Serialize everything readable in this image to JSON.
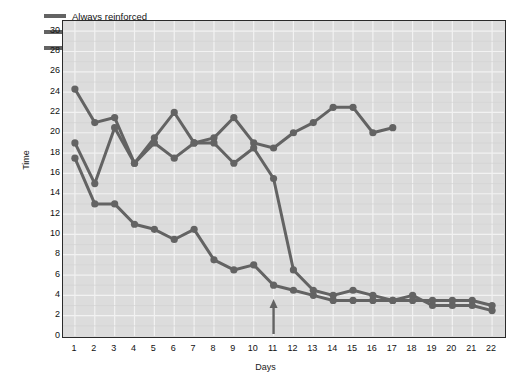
{
  "chart_data": {
    "type": "line",
    "title": "",
    "xlabel": "Days",
    "ylabel": "Time",
    "xlim": [
      0.4,
      22.6
    ],
    "ylim": [
      0,
      31
    ],
    "xticks": [
      1,
      2,
      3,
      4,
      5,
      6,
      7,
      8,
      9,
      10,
      11,
      12,
      13,
      14,
      15,
      16,
      17,
      18,
      19,
      20,
      21,
      22
    ],
    "yticks": [
      0,
      2,
      4,
      6,
      8,
      10,
      12,
      14,
      16,
      18,
      20,
      22,
      24,
      26,
      28,
      30
    ],
    "grid": true,
    "legend_position": "top-left",
    "annotations": [
      {
        "type": "arrow",
        "x": 11,
        "label": "",
        "direction": "up",
        "note": "marker at eleventh day"
      }
    ],
    "series": [
      {
        "name": "Always reinforced",
        "color": "#636363",
        "marker": "circle",
        "x": [
          1,
          2,
          3,
          4,
          5,
          6,
          7,
          8,
          9,
          10,
          11,
          12,
          13,
          14,
          15,
          16,
          17,
          18,
          19,
          20,
          21,
          22
        ],
        "values": [
          17.5,
          13,
          13,
          11,
          10.5,
          9.5,
          10.5,
          7.5,
          6.5,
          7,
          5,
          4.5,
          4,
          3.5,
          3.5,
          3.5,
          3.5,
          4,
          3,
          3,
          3,
          2.5
        ]
      },
      {
        "name": "Never reinforced",
        "color": "#636363",
        "marker": "circle",
        "x": [
          1,
          2,
          3,
          4,
          5,
          6,
          7,
          8,
          9,
          10,
          11,
          12,
          13,
          14,
          15,
          16,
          17
        ],
        "values": [
          24.3,
          21,
          21.5,
          17,
          19.5,
          22,
          19,
          19.5,
          21.5,
          19,
          18.5,
          20,
          21,
          22.5,
          22.5,
          20,
          20.5
        ]
      },
      {
        "name": "Reinforced starting on eleventh day",
        "color": "#636363",
        "marker": "circle",
        "x": [
          1,
          2,
          3,
          4,
          5,
          6,
          7,
          8,
          9,
          10,
          11,
          12,
          13,
          14,
          15,
          16,
          17,
          18,
          19,
          20,
          21,
          22
        ],
        "values": [
          19,
          15,
          20.5,
          17,
          19,
          17.5,
          19,
          19,
          17,
          18.5,
          15.5,
          6.5,
          4.5,
          4,
          4.5,
          4,
          3.5,
          3.5,
          3.5,
          3.5,
          3.5,
          3
        ]
      }
    ]
  },
  "legend": {
    "items": [
      {
        "label": "Always reinforced"
      },
      {
        "label": "Never reinforced"
      },
      {
        "label": "Reinforced starting on eleventh day"
      }
    ]
  },
  "colors": {
    "line": "#636363",
    "plot_background": "#dcdcdc",
    "grid": "#f2f2f2",
    "axis": "#2b2b2b",
    "text": "#141414"
  }
}
